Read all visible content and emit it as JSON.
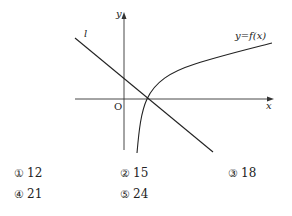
{
  "figure": {
    "axis_x_label": "x",
    "axis_y_label": "y",
    "origin_label": "O",
    "line_label": "l",
    "curve_label": "y=f(x)",
    "stroke_color": "#222222"
  },
  "choices": [
    {
      "marker": "①",
      "value": "12"
    },
    {
      "marker": "②",
      "value": "15"
    },
    {
      "marker": "③",
      "value": "18"
    },
    {
      "marker": "④",
      "value": "21"
    },
    {
      "marker": "⑤",
      "value": "24"
    }
  ]
}
